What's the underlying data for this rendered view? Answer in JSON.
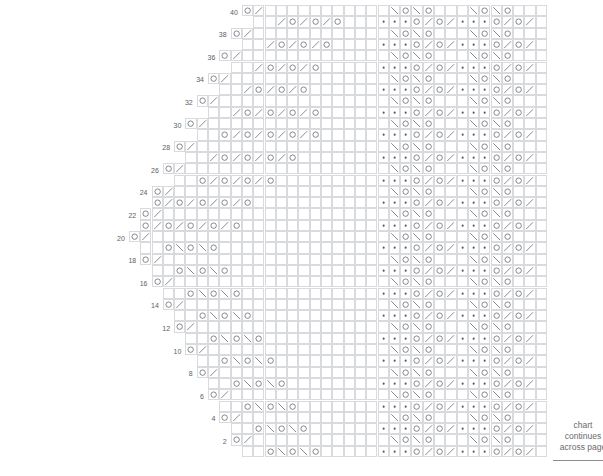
{
  "document": {
    "kind": "knitting-stitch-chart",
    "top_partial_caption": "",
    "side_note": {
      "line1": "chart",
      "line2": "continues",
      "line3": "across page"
    }
  },
  "chart": {
    "title": "",
    "total_rows": 40,
    "row_numbers": [
      2,
      4,
      6,
      8,
      10,
      12,
      14,
      16,
      18,
      20,
      22,
      24,
      26,
      28,
      30,
      32,
      34,
      36,
      38,
      40
    ],
    "row_number_side": "left",
    "numbered_rows_are": "even",
    "cell_width_px": 11.3,
    "cell_height_px": 11.3,
    "grid_line_color": "#d9dadd",
    "symbol_color": "#55565a",
    "background_color": "#ffffff",
    "legend": {
      "yarn_over": "O",
      "k2tog_right_slant": "/",
      "ssk_left_slant": "\\",
      "double_decrease": "∧",
      "purl": "•"
    },
    "symbol_names": {
      "O": "yarn-over",
      "/": "knit-two-together",
      "\\": "slip-slip-knit",
      "^": "centered-double-decrease",
      ".": "purl",
      "": "knit-blank"
    },
    "regions": {
      "left_shaped_lace": "stair-stepped triangular lace panel, widest at row 20",
      "right_repeat_panel": "vertical repeating purl-and-eyelet border panel"
    },
    "rows": [
      {
        "n": 40,
        "start": 11,
        "cells": "O/                                                            O^O                                     "
      },
      {
        "n": 39,
        "start": 12,
        "cells": "  /O/O/O                                          O/                                                "
      },
      {
        "n": 38,
        "start": 10,
        "cells": "O/                                                \\O                        O/                      "
      },
      {
        "n": 37,
        "start": 11,
        "cells": "  /O/O/O                                          \\O                        O/                      "
      },
      {
        "n": 36,
        "start": 9,
        "cells": "O/                                                  \\O                      O/                        "
      },
      {
        "n": 35,
        "start": 10,
        "cells": "  /O/O/O                                            \\O                    O/                        "
      },
      {
        "n": 34,
        "start": 8,
        "cells": "O/                                                    \\O                  O/                          "
      },
      {
        "n": 33,
        "start": 9,
        "cells": "  /O/O/O                                              \\O                  O/                          "
      },
      {
        "n": 32,
        "start": 7,
        "cells": "O/                                                      \\O              O/                            "
      },
      {
        "n": 31,
        "start": 8,
        "cells": "  /O/O/O/O                                              \\O              O/                            "
      },
      {
        "n": 30,
        "start": 6,
        "cells": "O/                                                        \\O          O/                              "
      },
      {
        "n": 29,
        "start": 7,
        "cells": "  O/O/O/O/O                                               \\O          O/                              "
      },
      {
        "n": 28,
        "start": 5,
        "cells": "O/                                                          \\O      O/                                "
      },
      {
        "n": 27,
        "start": 6,
        "cells": "  /O/O/O/O                                                  \\O      O/                                "
      },
      {
        "n": 26,
        "start": 4,
        "cells": "O/                                                            \\O  O/                                  "
      },
      {
        "n": 25,
        "start": 5,
        "cells": "  O/O/O/O                                                     \\O  O/                                  "
      },
      {
        "n": 24,
        "start": 3,
        "cells": "O/                                                              \\O O/                                 "
      },
      {
        "n": 23,
        "start": 3,
        "cells": "O/O/O/O/O                                                       \\OO/                                  "
      },
      {
        "n": 22,
        "start": 2,
        "cells": "O/                                                                \\O/                                 "
      },
      {
        "n": 21,
        "start": 2,
        "cells": "O/O/O/O/O                                                        O^O                                   "
      },
      {
        "n": 20,
        "start": 1,
        "cells": "O/                                                                                                    "
      },
      {
        "n": 19,
        "start": 2,
        "cells": "  O\\O\\O                                                          \\O                                    "
      },
      {
        "n": 18,
        "start": 2,
        "cells": "O/                                                                \\O                                   "
      },
      {
        "n": 17,
        "start": 3,
        "cells": "  O\\O\\O                                                         \\O    O^O                              "
      },
      {
        "n": 16,
        "start": 3,
        "cells": "O/                                                              \\O  \\O  O/                             "
      },
      {
        "n": 15,
        "start": 4,
        "cells": "  O\\O\\O                                                       \\O        O/                             "
      },
      {
        "n": 14,
        "start": 4,
        "cells": "O/                                                          \\O          O/                             "
      },
      {
        "n": 13,
        "start": 5,
        "cells": "  O\\O\\O                                                   \\O            O/                             "
      },
      {
        "n": 12,
        "start": 5,
        "cells": "O/                                                        \\O            O/                             "
      },
      {
        "n": 11,
        "start": 6,
        "cells": "  O\\O\\O                                                 \\O              O/                             "
      },
      {
        "n": 10,
        "start": 6,
        "cells": "O/                                                    \\O                O/                             "
      },
      {
        "n": 9,
        "start": 7,
        "cells": "  O\\O\\O                                             \\O                  O/                              "
      },
      {
        "n": 8,
        "start": 7,
        "cells": "O/                                                \\O                    O/                              "
      },
      {
        "n": 7,
        "start": 8,
        "cells": "  O\\O\\O                                         \\O                                                      "
      },
      {
        "n": 6,
        "start": 8,
        "cells": "O/                                            \\O                                                        "
      },
      {
        "n": 5,
        "start": 9,
        "cells": "  O\\O\\O                                     \\O                                                          "
      },
      {
        "n": 4,
        "start": 9,
        "cells": "O/                                        O                                                             "
      },
      {
        "n": 3,
        "start": 10,
        "cells": "  O\\O\\O                                 \\O                                                             "
      },
      {
        "n": 2,
        "start": 10,
        "cells": "O/                                                                                                     "
      },
      {
        "n": 1,
        "start": 11,
        "cells": "  O\\O\\O                                                                                                "
      }
    ],
    "right_panel": {
      "start_col": 23,
      "width_cols": 15,
      "odd_row_pattern": "...O/O/...O/O/",
      "even_row_pattern": "\\O\\O  \\O\\O",
      "description": "fifteen-column border repeat of purl dots, eyelets and paired decreases"
    }
  }
}
